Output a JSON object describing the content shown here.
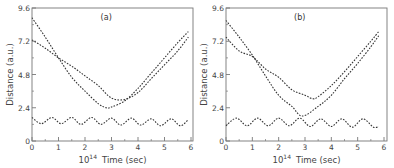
{
  "chart_data": [
    {
      "type": "line",
      "panel_label": "(a)",
      "title": "",
      "xlabel": "10^14 Time (sec)",
      "xlabel_prefix": "10",
      "xlabel_exp": "14",
      "xlabel_suffix": "Time (sec)",
      "ylabel": "Distance (a.u.)",
      "xlim": [
        0,
        6
      ],
      "ylim": [
        0,
        9.6
      ],
      "xticks": [
        "0",
        "1",
        "2",
        "3",
        "4",
        "5",
        "6"
      ],
      "yticks": [
        "0",
        "2.4",
        "4.8",
        "7.2",
        "9.6"
      ],
      "grid": false,
      "line_style": "dotted",
      "series": [
        {
          "name": "curve-1",
          "x": [
            0,
            0.5,
            1.0,
            1.5,
            2.0,
            2.5,
            2.8,
            3.0,
            3.5,
            4.0,
            4.5,
            5.0,
            5.5,
            5.9
          ],
          "y": [
            8.9,
            7.5,
            6.0,
            4.6,
            3.6,
            2.7,
            2.4,
            2.45,
            2.9,
            3.8,
            4.9,
            6.0,
            7.1,
            7.9
          ]
        },
        {
          "name": "curve-2",
          "x": [
            0,
            0.5,
            1.0,
            1.5,
            2.0,
            2.5,
            3.0,
            3.5,
            4.0,
            4.5,
            5.0,
            5.5,
            5.9
          ],
          "y": [
            7.3,
            6.7,
            6.0,
            5.4,
            4.7,
            4.0,
            3.1,
            3.0,
            3.5,
            4.5,
            5.5,
            6.5,
            7.5
          ]
        },
        {
          "name": "oscillating",
          "x": [
            0,
            0.35,
            0.75,
            1.1,
            1.5,
            1.85,
            2.25,
            2.6,
            3.0,
            3.35,
            3.75,
            4.1,
            4.5,
            4.85,
            5.25,
            5.6,
            5.9
          ],
          "y": [
            1.7,
            1.25,
            1.7,
            1.25,
            1.7,
            1.2,
            1.7,
            1.2,
            1.65,
            1.15,
            1.65,
            1.15,
            1.6,
            1.1,
            1.6,
            1.1,
            1.55
          ]
        }
      ]
    },
    {
      "type": "line",
      "panel_label": "(b)",
      "title": "",
      "xlabel": "10^14 Time (sec)",
      "xlabel_prefix": "10",
      "xlabel_exp": "14",
      "xlabel_suffix": "Time (sec)",
      "ylabel": "Distance (a.u.)",
      "xlim": [
        0,
        6
      ],
      "ylim": [
        0,
        9.6
      ],
      "xticks": [
        "0",
        "1",
        "2",
        "3",
        "4",
        "5",
        "6"
      ],
      "yticks": [
        "0",
        "2.4",
        "4.8",
        "7.2",
        "9.6"
      ],
      "grid": false,
      "line_style": "dotted",
      "series": [
        {
          "name": "curve-1",
          "x": [
            0,
            0.5,
            1.0,
            1.5,
            2.0,
            2.5,
            2.9,
            3.5,
            4.0,
            4.5,
            5.0,
            5.5,
            5.8
          ],
          "y": [
            8.7,
            7.5,
            6.2,
            4.7,
            3.3,
            2.5,
            1.8,
            2.5,
            3.3,
            4.5,
            5.6,
            6.8,
            7.6
          ]
        },
        {
          "name": "curve-2",
          "x": [
            0,
            0.5,
            1.0,
            1.5,
            2.0,
            2.5,
            3.0,
            3.3,
            3.5,
            4.0,
            4.5,
            5.0,
            5.5,
            5.8
          ],
          "y": [
            7.5,
            6.5,
            6.1,
            5.2,
            4.6,
            3.7,
            3.3,
            3.05,
            3.2,
            4.0,
            5.0,
            6.1,
            7.2,
            7.9
          ]
        },
        {
          "name": "oscillating",
          "x": [
            0,
            0.4,
            0.8,
            1.2,
            1.6,
            2.0,
            2.4,
            2.8,
            3.2,
            3.6,
            4.0,
            4.4,
            4.8,
            5.2,
            5.6,
            5.8
          ],
          "y": [
            1.1,
            1.65,
            1.1,
            1.65,
            1.1,
            1.65,
            1.1,
            1.65,
            1.05,
            1.6,
            1.05,
            1.6,
            1.0,
            1.6,
            1.0,
            1.05
          ]
        }
      ]
    }
  ]
}
